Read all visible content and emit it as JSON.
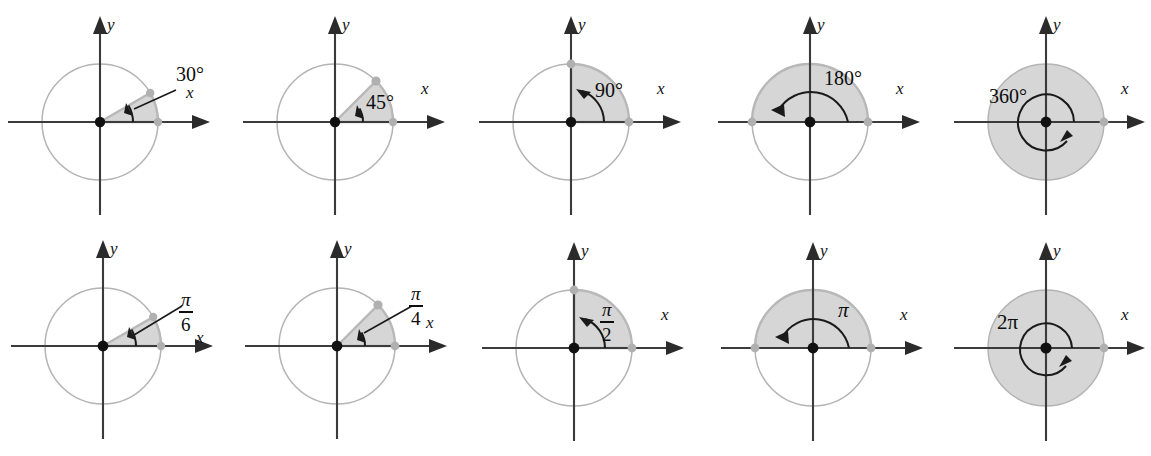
{
  "figure": {
    "rows": 2,
    "columns": 5,
    "background_color": "#ffffff",
    "shading_color": "#d6d6d6",
    "circle_color": "#b4b4b4",
    "axis_color": "#3b3b3b",
    "label_color": "#0d0d0d"
  },
  "panels": [
    {
      "id": "deg-30",
      "row": "top",
      "index": 1,
      "angle_degrees": 30,
      "angle_label": "30°",
      "label_type": "plain",
      "leader_line": true,
      "x_axis_label": "x",
      "y_axis_label": "y",
      "rotation_direction": "counterclockwise"
    },
    {
      "id": "deg-45",
      "row": "top",
      "index": 2,
      "angle_degrees": 45,
      "angle_label": "45°",
      "label_type": "plain",
      "leader_line": false,
      "x_axis_label": "x",
      "y_axis_label": "y",
      "rotation_direction": "counterclockwise"
    },
    {
      "id": "deg-90",
      "row": "top",
      "index": 3,
      "angle_degrees": 90,
      "angle_label": "90°",
      "label_type": "plain",
      "leader_line": false,
      "x_axis_label": "x",
      "y_axis_label": "y",
      "rotation_direction": "counterclockwise"
    },
    {
      "id": "deg-180",
      "row": "top",
      "index": 4,
      "angle_degrees": 180,
      "angle_label": "180°",
      "label_type": "plain",
      "leader_line": false,
      "x_axis_label": "x",
      "y_axis_label": "y",
      "rotation_direction": "counterclockwise"
    },
    {
      "id": "deg-360",
      "row": "top",
      "index": 5,
      "angle_degrees": 360,
      "angle_label": "360°",
      "label_type": "plain",
      "leader_line": false,
      "x_axis_label": "x",
      "y_axis_label": "y",
      "rotation_direction": "counterclockwise"
    },
    {
      "id": "rad-pi-6",
      "row": "bottom",
      "index": 1,
      "angle_degrees": 30,
      "angle_label": "π/6",
      "label_type": "fraction",
      "numerator": "π",
      "denominator": "6",
      "leader_line": true,
      "x_axis_label": "x",
      "y_axis_label": "y",
      "rotation_direction": "counterclockwise"
    },
    {
      "id": "rad-pi-4",
      "row": "bottom",
      "index": 2,
      "angle_degrees": 45,
      "angle_label": "π/4",
      "label_type": "fraction",
      "numerator": "π",
      "denominator": "4",
      "leader_line": true,
      "x_axis_label": "x",
      "y_axis_label": "y",
      "rotation_direction": "counterclockwise"
    },
    {
      "id": "rad-pi-2",
      "row": "bottom",
      "index": 3,
      "angle_degrees": 90,
      "angle_label": "π/2",
      "label_type": "fraction",
      "numerator": "π",
      "denominator": "2",
      "leader_line": false,
      "x_axis_label": "x",
      "y_axis_label": "y",
      "rotation_direction": "counterclockwise"
    },
    {
      "id": "rad-pi",
      "row": "bottom",
      "index": 4,
      "angle_degrees": 180,
      "angle_label": "π",
      "label_type": "plain-pi",
      "leader_line": false,
      "x_axis_label": "x",
      "y_axis_label": "y",
      "rotation_direction": "counterclockwise"
    },
    {
      "id": "rad-2pi",
      "row": "bottom",
      "index": 5,
      "angle_degrees": 360,
      "angle_label": "2π",
      "label_type": "plain-pi",
      "leader_line": false,
      "x_axis_label": "x",
      "y_axis_label": "y",
      "rotation_direction": "counterclockwise"
    }
  ]
}
